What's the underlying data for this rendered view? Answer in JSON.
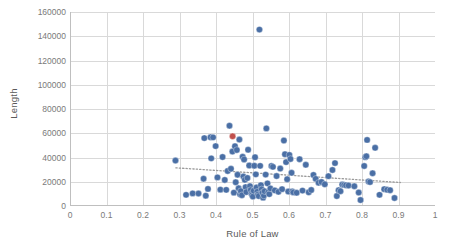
{
  "chart_data": {
    "type": "scatter",
    "title": "",
    "xlabel": "Rule of Law",
    "ylabel": "Length",
    "xlim": [
      0,
      1
    ],
    "ylim": [
      0,
      160000
    ],
    "xticks": [
      "0",
      "0.1",
      "0.2",
      "0.3",
      "0.4",
      "0.5",
      "0.6",
      "0.7",
      "0.8",
      "0.9",
      "1"
    ],
    "xtick_values": [
      0,
      0.1,
      0.2,
      0.3,
      0.4,
      0.5,
      0.6,
      0.7,
      0.8,
      0.9,
      1
    ],
    "yticks": [
      "0",
      "20000",
      "40000",
      "60000",
      "80000",
      "100000",
      "120000",
      "140000",
      "160000"
    ],
    "ytick_values": [
      0,
      20000,
      40000,
      60000,
      80000,
      100000,
      120000,
      140000,
      160000
    ],
    "grid": true,
    "grid_x": true,
    "grid_y": true,
    "legend": "none",
    "marker_color": "#4A6FA5",
    "marker_highlight_color": "#C0504D",
    "marker_radius": 3.2,
    "grid_color": "#D9D9D9",
    "axis_color": "#BFBFBF",
    "trendline": {
      "style": "dotted",
      "color": "#9A9A9A",
      "x_start": 0.29,
      "y_start": 31500,
      "x_end": 0.905,
      "y_end": 19400
    },
    "series": [
      {
        "name": "Countries",
        "color": "#4A6FA5",
        "points": [
          [
            0.289,
            37500
          ],
          [
            0.318,
            9200
          ],
          [
            0.336,
            10400
          ],
          [
            0.352,
            10300
          ],
          [
            0.366,
            22500
          ],
          [
            0.368,
            56000
          ],
          [
            0.372,
            8500
          ],
          [
            0.378,
            14100
          ],
          [
            0.385,
            56700
          ],
          [
            0.387,
            39300
          ],
          [
            0.392,
            56600
          ],
          [
            0.399,
            49400
          ],
          [
            0.404,
            23600
          ],
          [
            0.412,
            13500
          ],
          [
            0.418,
            40400
          ],
          [
            0.424,
            21500
          ],
          [
            0.428,
            13300
          ],
          [
            0.432,
            28900
          ],
          [
            0.437,
            66200
          ],
          [
            0.441,
            30700
          ],
          [
            0.445,
            44900
          ],
          [
            0.449,
            11000
          ],
          [
            0.452,
            49300
          ],
          [
            0.454,
            19600
          ],
          [
            0.457,
            46200
          ],
          [
            0.459,
            25800
          ],
          [
            0.462,
            14600
          ],
          [
            0.464,
            54800
          ],
          [
            0.466,
            9700
          ],
          [
            0.468,
            12300
          ],
          [
            0.471,
            8900
          ],
          [
            0.473,
            40600
          ],
          [
            0.475,
            24300
          ],
          [
            0.477,
            38400
          ],
          [
            0.479,
            21600
          ],
          [
            0.481,
            15600
          ],
          [
            0.483,
            11500
          ],
          [
            0.486,
            23100
          ],
          [
            0.488,
            46400
          ],
          [
            0.491,
            33400
          ],
          [
            0.493,
            16400
          ],
          [
            0.495,
            13200
          ],
          [
            0.497,
            10200
          ],
          [
            0.499,
            9100
          ],
          [
            0.501,
            7800
          ],
          [
            0.503,
            12600
          ],
          [
            0.505,
            33200
          ],
          [
            0.507,
            40200
          ],
          [
            0.509,
            26100
          ],
          [
            0.511,
            15300
          ],
          [
            0.513,
            11800
          ],
          [
            0.515,
            9400
          ],
          [
            0.517,
            8200
          ],
          [
            0.519,
            145500
          ],
          [
            0.521,
            33100
          ],
          [
            0.523,
            17200
          ],
          [
            0.525,
            13800
          ],
          [
            0.527,
            10900
          ],
          [
            0.529,
            6900
          ],
          [
            0.531,
            8600
          ],
          [
            0.533,
            12200
          ],
          [
            0.536,
            25900
          ],
          [
            0.538,
            64000
          ],
          [
            0.541,
            18700
          ],
          [
            0.543,
            11300
          ],
          [
            0.546,
            9800
          ],
          [
            0.549,
            14500
          ],
          [
            0.552,
            33000
          ],
          [
            0.556,
            32300
          ],
          [
            0.561,
            12900
          ],
          [
            0.566,
            24700
          ],
          [
            0.571,
            11700
          ],
          [
            0.576,
            30900
          ],
          [
            0.581,
            13900
          ],
          [
            0.586,
            54000
          ],
          [
            0.589,
            42700
          ],
          [
            0.592,
            36200
          ],
          [
            0.595,
            22100
          ],
          [
            0.598,
            11900
          ],
          [
            0.601,
            42100
          ],
          [
            0.604,
            38800
          ],
          [
            0.607,
            27400
          ],
          [
            0.609,
            12000
          ],
          [
            0.612,
            11200
          ],
          [
            0.621,
            10900
          ],
          [
            0.629,
            38600
          ],
          [
            0.637,
            12700
          ],
          [
            0.646,
            34000
          ],
          [
            0.654,
            11300
          ],
          [
            0.661,
            13200
          ],
          [
            0.667,
            25600
          ],
          [
            0.673,
            22400
          ],
          [
            0.681,
            19200
          ],
          [
            0.689,
            19800
          ],
          [
            0.698,
            17900
          ],
          [
            0.708,
            24600
          ],
          [
            0.719,
            29700
          ],
          [
            0.726,
            35400
          ],
          [
            0.731,
            8200
          ],
          [
            0.736,
            13000
          ],
          [
            0.741,
            12200
          ],
          [
            0.746,
            17700
          ],
          [
            0.751,
            17400
          ],
          [
            0.756,
            17100
          ],
          [
            0.763,
            16900
          ],
          [
            0.779,
            16300
          ],
          [
            0.791,
            11100
          ],
          [
            0.796,
            4900
          ],
          [
            0.806,
            33000
          ],
          [
            0.809,
            40300
          ],
          [
            0.812,
            41000
          ],
          [
            0.814,
            54500
          ],
          [
            0.818,
            20200
          ],
          [
            0.822,
            19700
          ],
          [
            0.829,
            27000
          ],
          [
            0.836,
            48000
          ],
          [
            0.848,
            9200
          ],
          [
            0.861,
            13900
          ],
          [
            0.869,
            13400
          ],
          [
            0.877,
            13000
          ],
          [
            0.889,
            6600
          ]
        ]
      },
      {
        "name": "Highlighted",
        "color": "#C0504D",
        "points": [
          [
            0.4455,
            57500
          ]
        ]
      }
    ]
  }
}
